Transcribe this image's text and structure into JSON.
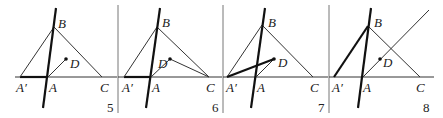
{
  "figure": {
    "panels": [
      {
        "number": "5",
        "labels": {
          "B": "B",
          "D": "D",
          "A_prime": "A′",
          "A": "A",
          "C": "C"
        }
      },
      {
        "number": "6",
        "labels": {
          "B": "B",
          "D": "D",
          "A_prime": "A′",
          "A": "A",
          "C": "C"
        }
      },
      {
        "number": "7",
        "labels": {
          "B": "B",
          "D": "D",
          "A_prime": "A′",
          "A": "A",
          "C": "C"
        }
      },
      {
        "number": "8",
        "labels": {
          "B": "B",
          "D": "D",
          "A_prime": "A′",
          "A": "A",
          "C": "C"
        }
      }
    ]
  }
}
